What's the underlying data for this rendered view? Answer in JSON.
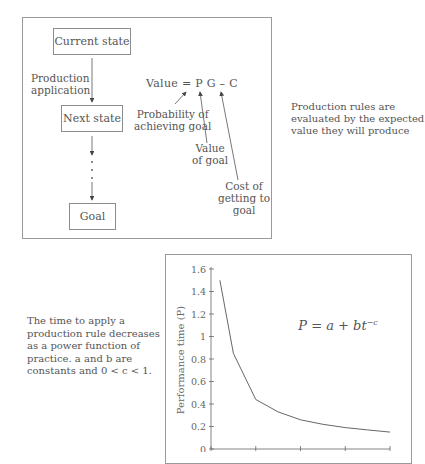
{
  "diagram": {
    "nodes": [
      {
        "id": "current",
        "label": "Current state"
      },
      {
        "id": "next",
        "label": "Next state"
      },
      {
        "id": "goal",
        "label": "Goal"
      }
    ],
    "edge_label_line1": "Production",
    "edge_label_line2": "application",
    "equation": "Value = P G – C",
    "annotations": {
      "probability_line1": "Probability of",
      "probability_line2": "achieving goal",
      "value_line1": "Value",
      "value_line2": "of goal",
      "cost_line1": "Cost of",
      "cost_line2": "getting to",
      "cost_line3": "goal"
    },
    "caption_line1": "Production rules are",
    "caption_line2": "evaluated by the expected",
    "caption_line3": "value they will produce"
  },
  "chart_caption": {
    "line1": "The time to apply a",
    "line2": "production rule decreases",
    "line3": "as a power function of",
    "line4": "practice. a and b are",
    "line5": "constants and 0 < c < 1."
  },
  "chart_data": {
    "type": "line",
    "title": "",
    "formula": "P = a + bt^-c",
    "formula_main": "P = a + bt",
    "formula_sup": "−c",
    "xlabel": "",
    "ylabel": "Performance time (P)",
    "ylim": [
      0,
      1.6
    ],
    "yticks": [
      "0",
      "0.2",
      "0.4",
      "0.6",
      "0.8",
      "1",
      "1.2",
      "1.4",
      "1.6"
    ],
    "xticks_count": 5,
    "grid": false,
    "series": [
      {
        "name": "Performance time",
        "x": [
          0.2,
          0.5,
          1.0,
          1.5,
          2.0,
          2.5,
          3.0,
          3.5,
          4.0
        ],
        "values": [
          1.5,
          0.85,
          0.44,
          0.33,
          0.26,
          0.22,
          0.19,
          0.17,
          0.15
        ]
      }
    ]
  }
}
